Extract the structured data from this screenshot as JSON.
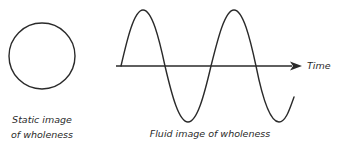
{
  "diagram": {
    "static": {
      "shape": "circle",
      "caption_line1": "Static image",
      "caption_line2": "of wholeness"
    },
    "fluid": {
      "shape": "sine-wave",
      "caption": "Fluid image of wholeness",
      "axis_label": "Time"
    },
    "colors": {
      "stroke": "#2a2a2a",
      "background": "#ffffff"
    }
  }
}
